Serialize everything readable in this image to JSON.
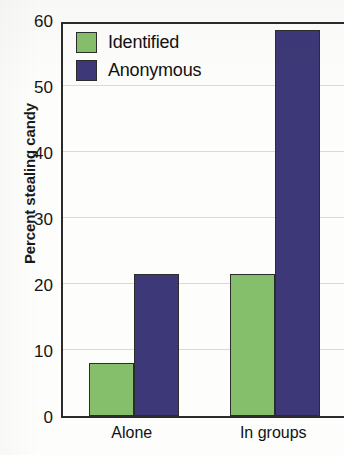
{
  "chart_data": {
    "type": "bar",
    "title": "",
    "xlabel": "",
    "ylabel": "Percent stealing candy",
    "categories": [
      "Alone",
      "In groups"
    ],
    "series": [
      {
        "name": "Identified",
        "color": "#86bf6b",
        "values": [
          8,
          21.5
        ]
      },
      {
        "name": "Anonymous",
        "color": "#3d3877",
        "values": [
          21.5,
          58.5
        ]
      }
    ],
    "ylim": [
      0,
      60
    ],
    "yticks": [
      0,
      10,
      20,
      30,
      40,
      50,
      60
    ],
    "ytick_labels": [
      "0",
      "10",
      "20",
      "30",
      "40",
      "50",
      "60"
    ],
    "grid": true,
    "legend_position": "top-left-inside"
  },
  "legend": {
    "items": [
      {
        "label": "Identified",
        "color": "#86bf6b"
      },
      {
        "label": "Anonymous",
        "color": "#3d3877"
      }
    ]
  },
  "axis": {
    "y_title": "Percent stealing candy",
    "x_categories": [
      "Alone",
      "In groups"
    ]
  }
}
